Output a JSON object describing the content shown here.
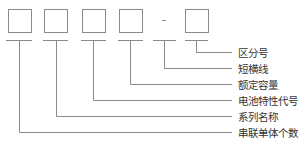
{
  "diagram": {
    "boxes": [
      {
        "id": 1,
        "x": 8
      },
      {
        "id": 2,
        "x": 44
      },
      {
        "id": 3,
        "x": 82
      },
      {
        "id": 4,
        "x": 119
      },
      {
        "id": 5,
        "x": 185
      }
    ],
    "separator": "-",
    "labels": [
      {
        "text": "区分号",
        "y": 47
      },
      {
        "text": "短横线",
        "y": 63
      },
      {
        "text": "额定容量",
        "y": 79
      },
      {
        "text": "电池特性代号",
        "y": 95
      },
      {
        "text": "系列名称",
        "y": 111
      },
      {
        "text": "串联单体个数",
        "y": 127
      }
    ],
    "line_color": "#888888",
    "text_color": "#333333"
  }
}
